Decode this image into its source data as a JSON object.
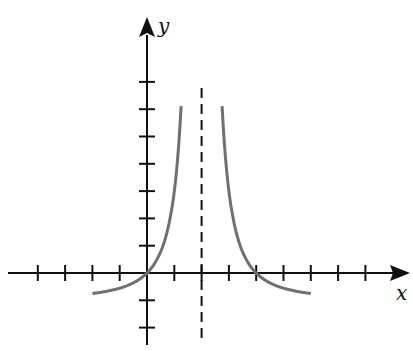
{
  "chart_data": {
    "type": "line",
    "title": "",
    "xlabel": "x",
    "ylabel": "y",
    "function": "y = 4/(x-2)^2 - 1",
    "vertical_asymptote": 2,
    "horizontal_asymptote": -1,
    "x_intercepts": [
      0,
      4
    ],
    "xlim": [
      -4,
      8
    ],
    "ylim": [
      -2,
      7
    ],
    "x_ticks": [
      -4,
      -3,
      -2,
      -1,
      1,
      2,
      3,
      4,
      5,
      6,
      7,
      8
    ],
    "y_ticks": [
      -2,
      -1,
      1,
      2,
      3,
      4,
      5,
      6,
      7
    ],
    "tick_labels_shown": false,
    "grid": false,
    "series": [
      {
        "name": "left branch",
        "x_range": [
          -2,
          1.25
        ]
      },
      {
        "name": "right branch",
        "x_range": [
          2.75,
          6
        ]
      }
    ],
    "colors": {
      "axes": "#111111",
      "curve": "#707070",
      "asymptote": "#111111"
    }
  }
}
